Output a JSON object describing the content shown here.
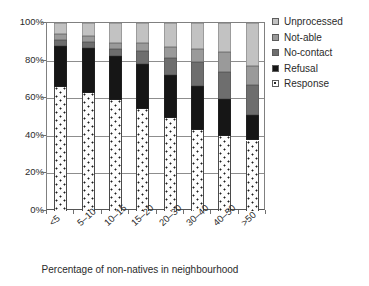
{
  "chart_data": {
    "type": "bar",
    "subtype": "stacked-100-percent",
    "title": "",
    "xlabel": "Percentage of non-natives in neighbourhood",
    "ylabel": "",
    "categories": [
      "<5",
      "5–10",
      "10–15",
      "15–20",
      "20–30",
      "30–40",
      "40–50",
      ">50"
    ],
    "ylim": [
      0,
      100
    ],
    "yticks": [
      0,
      20,
      40,
      60,
      80,
      100
    ],
    "ytick_labels": [
      "0%",
      "20%",
      "40%",
      "60%",
      "80%",
      "100%"
    ],
    "grid": true,
    "legend_position": "right",
    "stack_order_bottom_to_top": [
      "Response",
      "Refusal",
      "No-contact",
      "Not-able",
      "Unprocessed"
    ],
    "series": [
      {
        "name": "Response",
        "color": "#ffffff",
        "pattern": "dotted",
        "values": [
          66.0,
          63.0,
          59.0,
          54.5,
          49.5,
          43.0,
          40.0,
          37.5
        ]
      },
      {
        "name": "Refusal",
        "color": "#161616",
        "values": [
          22.0,
          23.5,
          23.5,
          23.5,
          23.0,
          23.5,
          19.5,
          13.5
        ]
      },
      {
        "name": "No-contact",
        "color": "#6e6e6e",
        "values": [
          3.0,
          3.5,
          3.5,
          7.0,
          9.0,
          12.5,
          14.5,
          16.0
        ]
      },
      {
        "name": "Not-able",
        "color": "#9a9a9a",
        "values": [
          3.0,
          3.0,
          3.5,
          4.5,
          5.5,
          7.0,
          10.5,
          10.0
        ]
      },
      {
        "name": "Unprocessed",
        "color": "#c2c2c2",
        "values": [
          6.0,
          7.0,
          10.5,
          10.5,
          13.0,
          14.0,
          15.5,
          23.0
        ]
      }
    ],
    "cumulative_tops": [
      [
        66.0,
        88.0,
        91.0,
        94.0,
        100.0
      ],
      [
        63.0,
        86.5,
        90.0,
        93.0,
        100.0
      ],
      [
        59.0,
        82.5,
        86.0,
        89.5,
        100.0
      ],
      [
        54.5,
        78.0,
        85.0,
        89.5,
        100.0
      ],
      [
        49.5,
        72.5,
        81.5,
        87.0,
        100.0
      ],
      [
        43.0,
        66.5,
        79.0,
        86.0,
        100.0
      ],
      [
        40.0,
        59.5,
        74.0,
        84.5,
        100.0
      ],
      [
        37.5,
        51.0,
        67.0,
        77.0,
        100.0
      ]
    ]
  },
  "legend": {
    "items": [
      {
        "label": "Unprocessed",
        "key": "unprocessed"
      },
      {
        "label": "Not-able",
        "key": "notable"
      },
      {
        "label": "No-contact",
        "key": "nocontact"
      },
      {
        "label": "Refusal",
        "key": "refusal"
      },
      {
        "label": "Response",
        "key": "response"
      }
    ]
  },
  "colors": {
    "response": "#ffffff",
    "refusal": "#161616",
    "nocontact": "#6e6e6e",
    "notable": "#9a9a9a",
    "unprocessed": "#c2c2c2",
    "axis": "#808080",
    "grid": "#8d8d8d",
    "text": "#2b2b2b"
  }
}
